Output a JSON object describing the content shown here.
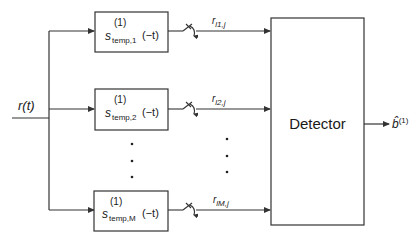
{
  "diagram": {
    "type": "block-diagram",
    "input": {
      "label": "r(t)",
      "label_main": "r",
      "label_arg": "(t)"
    },
    "filters": [
      {
        "id": "filter-1",
        "sup": "(1)",
        "main": "s",
        "sub": "temp,1",
        "arg": "(−t)"
      },
      {
        "id": "filter-2",
        "sup": "(1)",
        "main": "s",
        "sub": "temp,2",
        "arg": "(−t)"
      },
      {
        "id": "filter-M",
        "sup": "(1)",
        "main": "s",
        "sub": "temp,M",
        "arg": "(−t)"
      }
    ],
    "sampler_outputs": [
      {
        "main": "r",
        "sub": "l1,j"
      },
      {
        "main": "r",
        "sub": "l2,j"
      },
      {
        "main": "r",
        "sub": "lM,j"
      }
    ],
    "ellipsis": "⋮",
    "detector": {
      "label": "Detector"
    },
    "output": {
      "main": "b̂",
      "sup": "(1)"
    },
    "colors": {
      "line": "#333333",
      "text": "#1a1a1a",
      "background": "#ffffff"
    }
  }
}
